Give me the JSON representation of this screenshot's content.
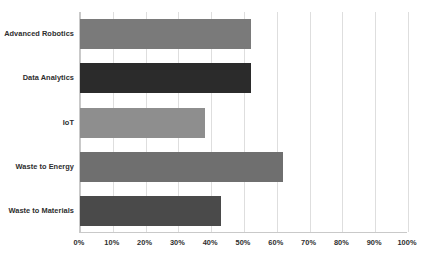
{
  "chart_data": {
    "type": "bar",
    "orientation": "horizontal",
    "title": "",
    "xlabel": "",
    "ylabel": "",
    "categories": [
      "Advanced Robotics",
      "Data Analytics",
      "IoT",
      "Waste to Energy",
      "Waste to Materials"
    ],
    "values": [
      52,
      52,
      38,
      62,
      43
    ],
    "bar_colors": [
      "#7a7a7a",
      "#2b2b2b",
      "#8e8e8e",
      "#6f6f6f",
      "#4a4a4a"
    ],
    "xlim": [
      0,
      100
    ],
    "x_tick_values": [
      0,
      10,
      20,
      30,
      40,
      50,
      60,
      70,
      80,
      90,
      100
    ],
    "x_tick_labels": [
      "0%",
      "10%",
      "20%",
      "30%",
      "40%",
      "50%",
      "60%",
      "70%",
      "80%",
      "90%",
      "100%"
    ],
    "grid": true,
    "grid_axis": "x",
    "legend": false,
    "legend_position": "none",
    "value_labels": false,
    "axis_color": "#c9c9c9",
    "grid_color": "#dedede",
    "background_color": "#ffffff",
    "label_color": "#2e2e2e"
  }
}
